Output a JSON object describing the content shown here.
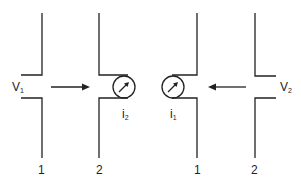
{
  "diagram": {
    "left": {
      "voltage_label": "V",
      "voltage_sub": "1",
      "current_label": "i",
      "current_sub": "2",
      "electrode_labels": [
        "1",
        "2"
      ]
    },
    "right": {
      "voltage_label": "V",
      "voltage_sub": "2",
      "current_label": "i",
      "current_sub": "1",
      "electrode_labels": [
        "1",
        "2"
      ]
    },
    "stroke_color": "#222222"
  }
}
